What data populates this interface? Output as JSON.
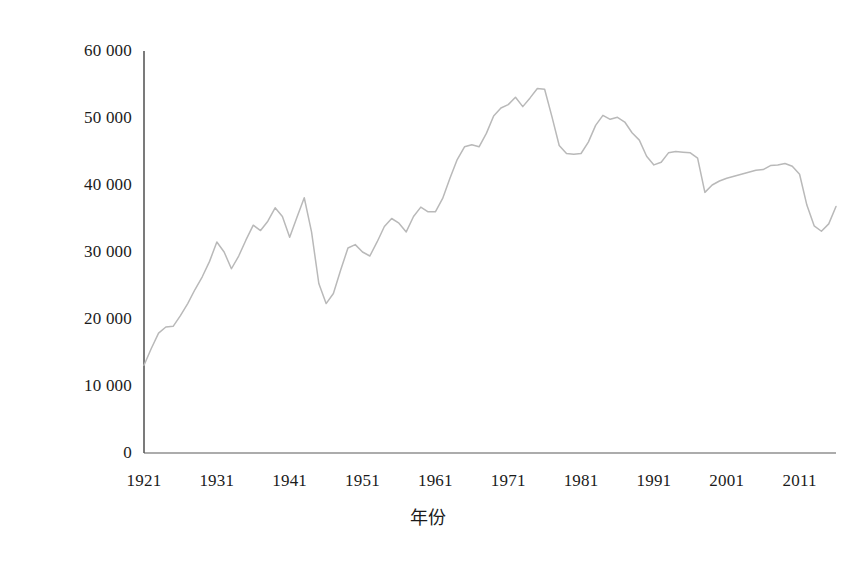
{
  "chart_data": {
    "type": "line",
    "title": "",
    "subtitle": "",
    "xlabel": "年份",
    "ylabel": "死亡人数",
    "xlim": [
      1921,
      2016
    ],
    "ylim": [
      0,
      60000
    ],
    "grid": false,
    "legend": null,
    "legend_position": "none",
    "line_color": "#b9b9b9",
    "axis_color": "#555555",
    "y_ticks": [
      0,
      10000,
      20000,
      30000,
      40000,
      50000,
      60000
    ],
    "y_tick_labels": [
      "0",
      "10 000",
      "20 000",
      "30 000",
      "40 000",
      "50 000",
      "60 000"
    ],
    "x_ticks": [
      1921,
      1931,
      1941,
      1951,
      1961,
      1971,
      1981,
      1991,
      2001,
      2011
    ],
    "x_tick_labels": [
      "1921",
      "1931",
      "1941",
      "1951",
      "1961",
      "1971",
      "1981",
      "1991",
      "2001",
      "2011"
    ],
    "series": [
      {
        "name": "死亡人数",
        "x": [
          1921,
          1922,
          1923,
          1924,
          1925,
          1926,
          1927,
          1928,
          1929,
          1930,
          1931,
          1932,
          1933,
          1934,
          1935,
          1936,
          1937,
          1938,
          1939,
          1940,
          1941,
          1942,
          1943,
          1944,
          1945,
          1946,
          1947,
          1948,
          1949,
          1950,
          1951,
          1952,
          1953,
          1954,
          1955,
          1956,
          1957,
          1958,
          1959,
          1960,
          1961,
          1962,
          1963,
          1964,
          1965,
          1966,
          1967,
          1968,
          1969,
          1970,
          1971,
          1972,
          1973,
          1974,
          1975,
          1976,
          1977,
          1978,
          1979,
          1980,
          1981,
          1982,
          1983,
          1984,
          1985,
          1986,
          1987,
          1988,
          1989,
          1990,
          1991,
          1992,
          1993,
          1994,
          1995,
          1996,
          1997,
          1998,
          1999,
          2000,
          2001,
          2002,
          2003,
          2004,
          2005,
          2006,
          2007,
          2008,
          2009,
          2010,
          2011,
          2012,
          2013,
          2014,
          2015,
          2016
        ],
        "values": [
          13100,
          15600,
          17900,
          18800,
          18900,
          20500,
          22300,
          24400,
          26300,
          28600,
          31500,
          30000,
          27500,
          29400,
          31800,
          34000,
          33200,
          34600,
          36600,
          35300,
          32200,
          35200,
          38100,
          33000,
          25300,
          22300,
          23800,
          27300,
          30600,
          31100,
          30000,
          29400,
          31500,
          33800,
          35000,
          34300,
          33000,
          35300,
          36700,
          36000,
          36000,
          38000,
          41000,
          43800,
          45700,
          46000,
          45700,
          47700,
          50300,
          51500,
          52000,
          53100,
          51700,
          53000,
          54400,
          54300,
          50200,
          45900,
          44700,
          44600,
          44700,
          46400,
          48900,
          50400,
          49800,
          50100,
          49400,
          47800,
          46700,
          44300,
          43000,
          43400,
          44800,
          45000,
          44900,
          44800,
          44000,
          38900,
          40000,
          40600,
          41000,
          41300,
          41600,
          41900,
          42200,
          42300,
          42900,
          43000,
          43200,
          42800,
          41600,
          37000,
          33900,
          33100,
          34200,
          36800
        ],
        "start_value": 13100,
        "end_value": 36800,
        "peak_year": 1975,
        "peak_value": 54400,
        "min_year": 1921,
        "min_value": 13100
      }
    ]
  },
  "axis_titles": {
    "y": "死亡人数",
    "x": "年份"
  }
}
